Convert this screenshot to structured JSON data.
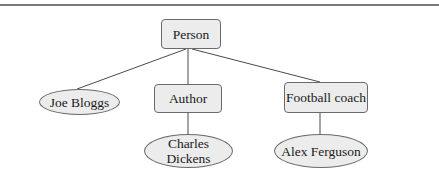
{
  "diagram": {
    "type": "class-instance hierarchy",
    "colors": {
      "node_fill": "#ececec",
      "node_border": "#6a6a6a",
      "edge": "#4a4a4a",
      "rule": "#7a7a7a"
    },
    "nodes": {
      "person": {
        "label": "Person",
        "shape": "rounded-rectangle"
      },
      "joe_bloggs": {
        "label": "Joe Bloggs",
        "shape": "ellipse"
      },
      "author": {
        "label": "Author",
        "shape": "rounded-rectangle"
      },
      "football_coach": {
        "label": "Football coach",
        "shape": "rounded-rectangle"
      },
      "charles_dickens": {
        "label_line1": "Charles",
        "label_line2": "Dickens",
        "shape": "ellipse"
      },
      "alex_ferguson": {
        "label": "Alex Ferguson",
        "shape": "ellipse"
      }
    },
    "edges": [
      {
        "from": "Person",
        "to": "Joe Bloggs"
      },
      {
        "from": "Person",
        "to": "Author"
      },
      {
        "from": "Person",
        "to": "Football coach"
      },
      {
        "from": "Author",
        "to": "Charles Dickens"
      },
      {
        "from": "Football coach",
        "to": "Alex Ferguson"
      }
    ]
  }
}
